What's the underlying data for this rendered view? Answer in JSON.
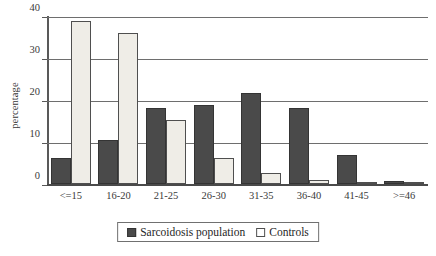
{
  "chart_data": {
    "type": "bar",
    "title": "",
    "xlabel": "",
    "ylabel": "percentage",
    "ylim": [
      0,
      40
    ],
    "yticks": [
      0,
      10,
      20,
      30,
      40
    ],
    "grid": true,
    "legend_position": "bottom-center",
    "categories": [
      "<=15",
      "16-20",
      "21-25",
      "26-30",
      "31-35",
      "36-40",
      "41-45",
      ">=46"
    ],
    "series": [
      {
        "name": "Sarcoidosis population",
        "color": "#4a4a4a",
        "values": [
          6.2,
          10.6,
          18.1,
          18.9,
          21.8,
          18.2,
          7.1,
          0.9
        ]
      },
      {
        "name": "Controls",
        "color": "#efede7",
        "values": [
          38.8,
          36.0,
          15.4,
          6.2,
          2.8,
          1.1,
          0.5,
          0.4
        ]
      }
    ]
  },
  "axis": {
    "y_title": "percentage",
    "y_ticks": [
      "40",
      "30",
      "20",
      "10",
      "0"
    ],
    "x_ticks": [
      "<=15",
      "16-20",
      "21-25",
      "26-30",
      "31-35",
      "36-40",
      "41-45",
      ">=46"
    ]
  },
  "legend": {
    "items": [
      {
        "label": "Sarcoidosis population",
        "swatch": "filled-dark-square"
      },
      {
        "label": "Controls",
        "swatch": "open-white-square"
      }
    ]
  }
}
